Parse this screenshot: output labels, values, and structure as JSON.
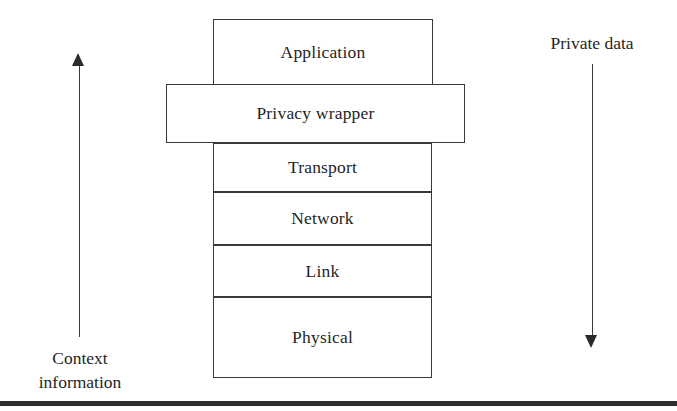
{
  "figure": {
    "background_color": "#ffffff",
    "line_color": "#3a3a3a",
    "text_color": "#1f1f1f",
    "rule_color": "#2e2e2e"
  },
  "stack": {
    "layers": [
      {
        "id": "application",
        "label": "Application"
      },
      {
        "id": "transport",
        "label": "Transport"
      },
      {
        "id": "network",
        "label": "Network"
      },
      {
        "id": "link",
        "label": "Link"
      },
      {
        "id": "physical",
        "label": "Physical"
      }
    ],
    "overlay": {
      "id": "privacy-wrapper",
      "label": "Privacy wrapper"
    }
  },
  "annotations": {
    "left": {
      "direction": "up",
      "caption_line_1": "Context",
      "caption_line_2": "information"
    },
    "right": {
      "direction": "down",
      "caption": "Private data"
    }
  }
}
